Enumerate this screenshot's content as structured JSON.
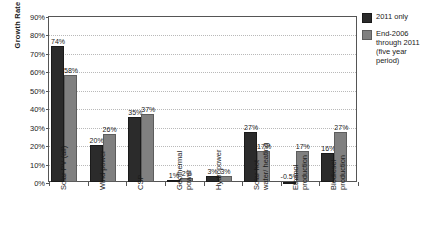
{
  "chart_data": {
    "type": "bar",
    "title": "",
    "xlabel": "",
    "ylabel": "Growth Rate",
    "ylim": [
      0,
      90
    ],
    "ytick_labels": [
      "0%",
      "10%",
      "20%",
      "30%",
      "40%",
      "50%",
      "60%",
      "70%",
      "80%",
      "90%"
    ],
    "ytick_values": [
      0,
      10,
      20,
      30,
      40,
      50,
      60,
      70,
      80,
      90
    ],
    "grid": true,
    "legend_position": "right",
    "categories": [
      "Solar PV (all)",
      "Wind power",
      "CSP",
      "Geothermal\npower",
      "Hydropower",
      "Solar hot\nwater/ heating",
      "Ethanol\nproduction",
      "Biodiesel\nproduction"
    ],
    "series": [
      {
        "name": "2011 only",
        "color": "#2b2b2b",
        "values": [
          74,
          20,
          35,
          1,
          3,
          27,
          -0.5,
          16
        ],
        "labels": [
          "74%",
          "20%",
          "35%",
          "1%",
          "3%",
          "27%",
          "-0.5%",
          "16%"
        ]
      },
      {
        "name": "End-2006 through 2011 (five year period)",
        "color": "#808080",
        "values": [
          58,
          26,
          37,
          2,
          3,
          17,
          17,
          27
        ],
        "labels": [
          "58%",
          "26%",
          "37%",
          "2%",
          "3%",
          "17%",
          "17%",
          "27%"
        ]
      }
    ]
  },
  "legend": {
    "items": [
      {
        "label": "2011 only",
        "color": "#2b2b2b"
      },
      {
        "label": "End-2006\nthrough 2011\n(five year\nperiod)",
        "color": "#808080"
      }
    ]
  }
}
